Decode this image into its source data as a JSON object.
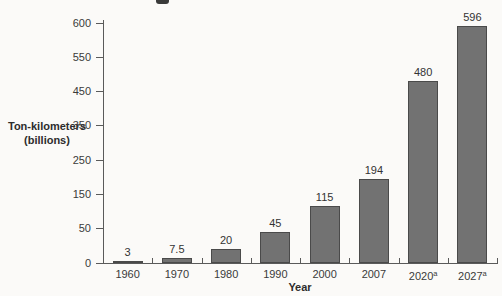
{
  "window": {
    "description": "Scanned textbook bar graph of freight traffic by year, title cropped off at top"
  },
  "colors": {
    "background": "#fbfaf8",
    "bar_fill": "#727272",
    "bar_border": "#4a4a4a",
    "axis": "#5a5a5a",
    "text": "#2d2d2d"
  },
  "chart_data": {
    "type": "bar",
    "title": "",
    "xlabel": "Year",
    "ylabel_line1": "Ton-kilometers",
    "ylabel_line2": "(billions)",
    "categories": [
      {
        "label": "1960",
        "sup": ""
      },
      {
        "label": "1970",
        "sup": ""
      },
      {
        "label": "1980",
        "sup": ""
      },
      {
        "label": "1990",
        "sup": ""
      },
      {
        "label": "2000",
        "sup": ""
      },
      {
        "label": "2007",
        "sup": ""
      },
      {
        "label": "2020",
        "sup": "a"
      },
      {
        "label": "2027",
        "sup": "a"
      }
    ],
    "values": [
      3,
      7.5,
      20,
      45,
      115,
      194,
      480,
      596
    ],
    "value_labels": [
      "3",
      "7.5",
      "20",
      "45",
      "115",
      "194",
      "480",
      "596"
    ],
    "y_tick_labels": [
      "0",
      "50",
      "150",
      "250",
      "350",
      "450",
      "550",
      "600"
    ],
    "y_tick_values": [
      0,
      50,
      150,
      250,
      350,
      450,
      550,
      600
    ],
    "ylim": [
      0,
      600
    ],
    "grid": false,
    "legend": null,
    "axis_style": "y tick labels are equally spaced despite unequal increments (compressed scale); bars gray with darker outline; x ticks mark category boundaries"
  }
}
